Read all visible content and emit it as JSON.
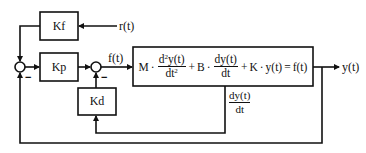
{
  "diagram": {
    "type": "control-block-diagram",
    "blocks": {
      "kf": "Kf",
      "kp": "Kp",
      "kd": "Kd",
      "plant": {
        "term1_coef": "M",
        "term1_num": "d",
        "term1_num_sup": "2",
        "term1_num_rest": "y(t)",
        "term1_den": "dt",
        "term1_den_sup": "2",
        "plus1": "+",
        "term2_coef": "B",
        "term2_num": "dy(t)",
        "term2_den": "dt",
        "plus2": "+",
        "term3": "K",
        "dot": "·",
        "term3_var": "y(t)",
        "equals": "=",
        "rhs": "f(t)"
      }
    },
    "signals": {
      "reference": "r(t)",
      "force": "f(t)",
      "output": "y(t)",
      "velocity_num": "dy(t)",
      "velocity_den": "dt"
    },
    "junction_signs": {
      "junction1_minus": "−",
      "junction2_minus": "−"
    },
    "stroke_color": "#111111",
    "background_color": "#ffffff"
  }
}
